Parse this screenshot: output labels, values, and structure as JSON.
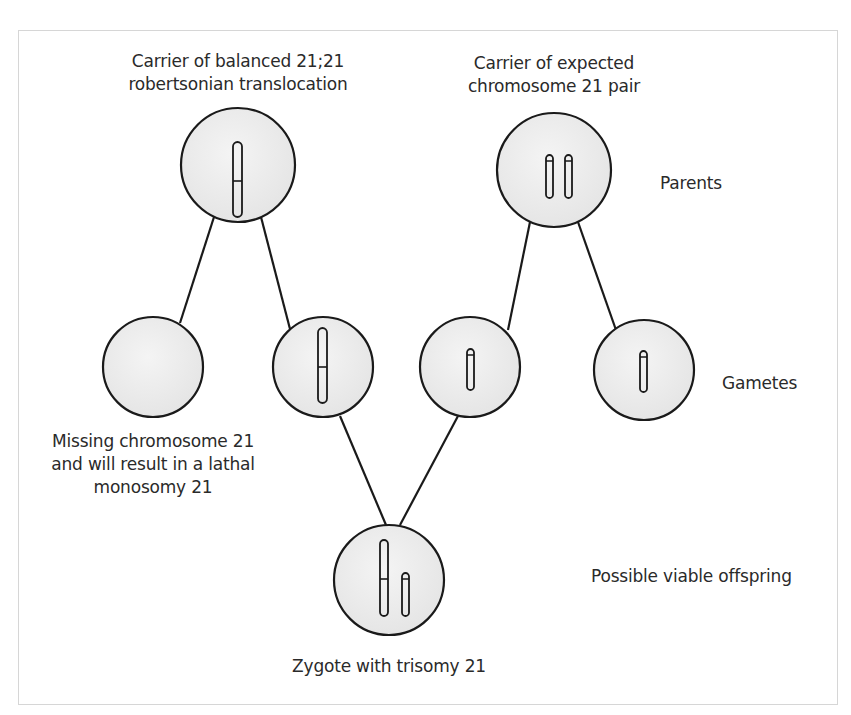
{
  "labels": {
    "parent_left": [
      "Carrier of balanced 21;21",
      "robertsonian translocation"
    ],
    "parent_right": [
      "Carrier of expected",
      "chromosome 21 pair"
    ],
    "row_parents": "Parents",
    "row_gametes": "Gametes",
    "row_offspring": "Possible viable offspring",
    "missing_gamete": [
      "Missing chromosome 21",
      "and will result in a lathal",
      "monosomy 21"
    ],
    "zygote": "Zygote with trisomy 21"
  },
  "nodes": [
    {
      "id": "parent_left",
      "role": "parent",
      "cx": 238,
      "cy": 165,
      "r": 57,
      "chromosomes": "fused 21;21 translocation"
    },
    {
      "id": "parent_right",
      "role": "parent",
      "cx": 554,
      "cy": 170,
      "r": 57,
      "chromosomes": "two normal 21"
    },
    {
      "id": "gamete_1",
      "role": "gamete",
      "cx": 153,
      "cy": 367,
      "r": 50,
      "chromosomes": "none"
    },
    {
      "id": "gamete_2",
      "role": "gamete",
      "cx": 323,
      "cy": 367,
      "r": 50,
      "chromosomes": "fused 21;21 translocation"
    },
    {
      "id": "gamete_3",
      "role": "gamete",
      "cx": 470,
      "cy": 367,
      "r": 50,
      "chromosomes": "one normal 21"
    },
    {
      "id": "gamete_4",
      "role": "gamete",
      "cx": 644,
      "cy": 370,
      "r": 50,
      "chromosomes": "one normal 21"
    },
    {
      "id": "zygote",
      "role": "offspring",
      "cx": 389,
      "cy": 580,
      "r": 55,
      "chromosomes": "fused 21;21 + one normal 21"
    }
  ],
  "edges": [
    [
      "parent_left",
      "gamete_1"
    ],
    [
      "parent_left",
      "gamete_2"
    ],
    [
      "parent_right",
      "gamete_3"
    ],
    [
      "parent_right",
      "gamete_4"
    ],
    [
      "gamete_2",
      "zygote"
    ],
    [
      "gamete_3",
      "zygote"
    ]
  ],
  "colors": {
    "circle_fill": "#ececec",
    "stroke": "#1a1a1a",
    "frame": "#d6d6d6",
    "text": "#2a2a2a"
  }
}
